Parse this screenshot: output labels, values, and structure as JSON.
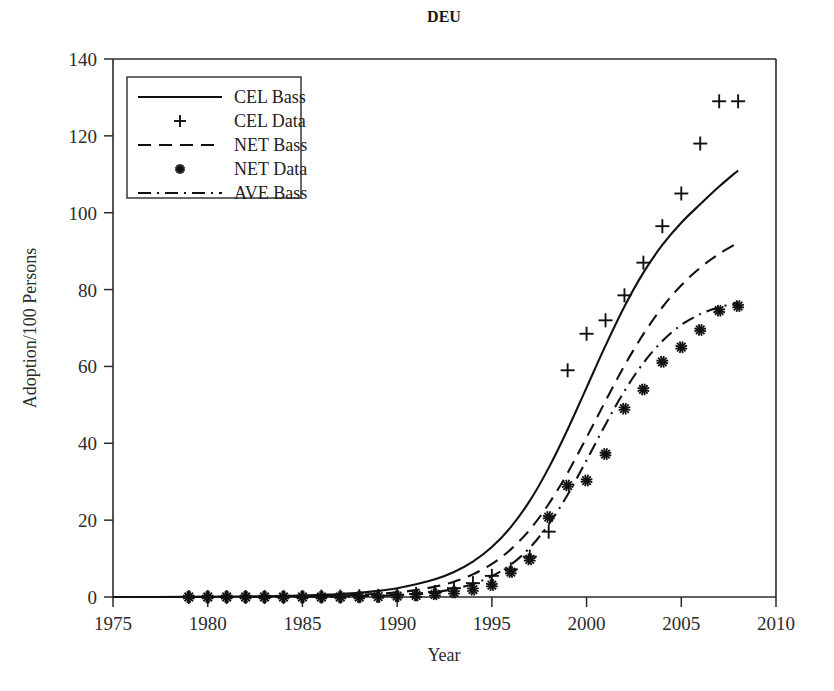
{
  "chart_data": {
    "type": "line",
    "title": "DEU",
    "xlabel": "Year",
    "ylabel": "Adoption/100 Persons",
    "xlim": [
      1975,
      2010
    ],
    "ylim": [
      0,
      140
    ],
    "xticks": [
      1975,
      1980,
      1985,
      1990,
      1995,
      2000,
      2005,
      2010
    ],
    "yticks": [
      0,
      20,
      40,
      60,
      80,
      100,
      120,
      140
    ],
    "grid": false,
    "legend_position": "upper left",
    "legend": [
      {
        "label": "CEL Bass",
        "style": "solid-line"
      },
      {
        "label": "CEL Data",
        "style": "plus-marker"
      },
      {
        "label": "NET Bass",
        "style": "dashed-line"
      },
      {
        "label": "NET Data",
        "style": "star-marker"
      },
      {
        "label": "AVE Bass",
        "style": "dashdot-line"
      }
    ],
    "series": [
      {
        "name": "CEL Bass",
        "style": "solid-line",
        "x": [
          1975,
          1977,
          1979,
          1981,
          1983,
          1985,
          1986,
          1987,
          1988,
          1989,
          1990,
          1991,
          1992,
          1993,
          1994,
          1995,
          1996,
          1997,
          1998,
          1999,
          2000,
          2001,
          2002,
          2003,
          2004,
          2005,
          2006,
          2007,
          2008
        ],
        "values": [
          0.0,
          0.0,
          0.05,
          0.1,
          0.2,
          0.4,
          0.6,
          0.8,
          1.1,
          1.6,
          2.3,
          3.3,
          4.6,
          6.5,
          9.2,
          13.0,
          18.2,
          25.0,
          33.6,
          43.6,
          54.5,
          65.4,
          75.6,
          84.4,
          91.6,
          97.4,
          102.2,
          106.8,
          111.0
        ]
      },
      {
        "name": "CEL Data",
        "style": "plus-marker",
        "x": [
          1979,
          1980,
          1981,
          1982,
          1983,
          1984,
          1985,
          1986,
          1987,
          1988,
          1989,
          1990,
          1991,
          1992,
          1993,
          1994,
          1995,
          1996,
          1997,
          1998,
          1999,
          2000,
          2001,
          2002,
          2003,
          2004,
          2005,
          2006,
          2007,
          2008
        ],
        "values": [
          0.0,
          0.0,
          0.0,
          0.0,
          0.0,
          0.0,
          0.0,
          0.1,
          0.1,
          0.2,
          0.3,
          0.5,
          0.8,
          1.3,
          2.3,
          3.6,
          5.5,
          7.2,
          10.5,
          17.0,
          59.0,
          68.5,
          72.0,
          78.5,
          87.0,
          96.5,
          105.0,
          118.0,
          129.0,
          129.0
        ]
      },
      {
        "name": "NET Bass",
        "style": "dashed-line",
        "x": [
          1975,
          1979,
          1983,
          1986,
          1988,
          1990,
          1991,
          1992,
          1993,
          1994,
          1995,
          1996,
          1997,
          1998,
          1999,
          2000,
          2001,
          2002,
          2003,
          2004,
          2005,
          2006,
          2007,
          2008
        ],
        "values": [
          0.0,
          0.02,
          0.1,
          0.3,
          0.6,
          1.2,
          1.8,
          2.7,
          4.0,
          5.9,
          8.6,
          12.4,
          17.5,
          24.2,
          32.3,
          41.5,
          51.0,
          60.2,
          68.4,
          75.4,
          81.1,
          85.7,
          89.3,
          92.2
        ]
      },
      {
        "name": "NET Data",
        "style": "star-marker",
        "x": [
          1979,
          1980,
          1981,
          1982,
          1983,
          1984,
          1985,
          1986,
          1987,
          1988,
          1989,
          1990,
          1991,
          1992,
          1993,
          1994,
          1995,
          1996,
          1997,
          1998,
          1999,
          2000,
          2001,
          2002,
          2003,
          2004,
          2005,
          2006,
          2007,
          2008
        ],
        "values": [
          0.0,
          0.0,
          0.0,
          0.0,
          0.0,
          0.0,
          0.0,
          0.0,
          0.0,
          0.0,
          0.1,
          0.2,
          0.4,
          0.7,
          1.2,
          1.9,
          3.1,
          6.5,
          9.8,
          20.8,
          29.0,
          30.3,
          37.2,
          49.0,
          54.0,
          61.2,
          65.0,
          69.5,
          74.5,
          75.7
        ]
      },
      {
        "name": "AVE Bass",
        "style": "dashdot-line",
        "x": [
          1975,
          1980,
          1985,
          1988,
          1990,
          1992,
          1993,
          1994,
          1995,
          1996,
          1997,
          1998,
          1999,
          2000,
          2001,
          2002,
          2003,
          2004,
          2005,
          2006,
          2007,
          2008
        ],
        "values": [
          0.0,
          0.0,
          0.05,
          0.2,
          0.5,
          1.3,
          2.1,
          3.4,
          5.4,
          8.4,
          12.8,
          18.9,
          26.6,
          35.6,
          44.9,
          53.6,
          60.9,
          66.6,
          70.8,
          73.6,
          75.4,
          76.6
        ]
      }
    ]
  }
}
